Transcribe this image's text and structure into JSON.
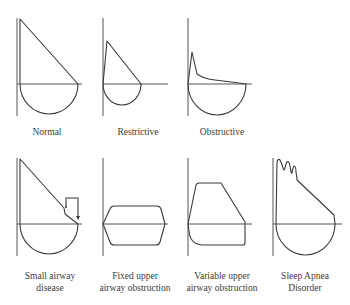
{
  "figure": {
    "colors": {
      "line": "#3a3a3a",
      "axis": "#555555",
      "background": "#ffffff"
    },
    "panels": [
      {
        "id": "normal",
        "label_lines": [
          "Normal"
        ]
      },
      {
        "id": "restrictive",
        "label_lines": [
          "Restrictive"
        ]
      },
      {
        "id": "obstructive",
        "label_lines": [
          "Obstructive"
        ]
      },
      {
        "id": "small-airway",
        "label_lines": [
          "Small airway",
          "disease"
        ]
      },
      {
        "id": "fixed-upper",
        "label_lines": [
          "Fixed upper",
          "airway obstruction"
        ]
      },
      {
        "id": "variable-upper",
        "label_lines": [
          "Variable upper",
          "airway obstruction"
        ]
      },
      {
        "id": "sleep-apnea",
        "label_lines": [
          "Sleep Apnea",
          "Disorder"
        ]
      }
    ]
  }
}
